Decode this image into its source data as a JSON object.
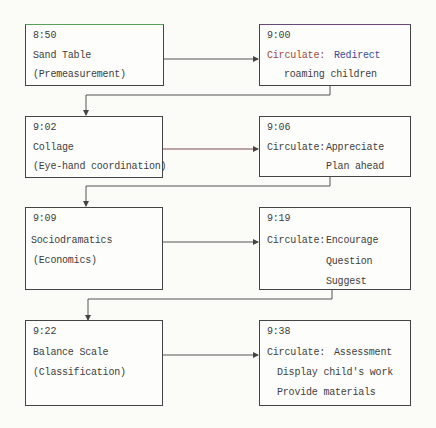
{
  "diagram": {
    "type": "flowchart",
    "rows": [
      {
        "activity": {
          "time": "8:50",
          "title": "Sand Table",
          "subtitle": "(Premeasurement)"
        },
        "circulate": {
          "time": "9:00",
          "label": "Circulate:",
          "actions": [
            "Redirect",
            "roaming children"
          ]
        }
      },
      {
        "activity": {
          "time": "9:02",
          "title": "Collage",
          "subtitle": "(Eye-hand coordination)"
        },
        "circulate": {
          "time": "9:06",
          "label": "Circulate:",
          "actions": [
            "Appreciate",
            "Plan ahead"
          ]
        }
      },
      {
        "activity": {
          "time": "9:09",
          "title": "Sociodramatics",
          "subtitle": "(Economics)"
        },
        "circulate": {
          "time": "9:19",
          "label": "Circulate:",
          "actions": [
            "Encourage",
            "Question",
            "Suggest"
          ]
        }
      },
      {
        "activity": {
          "time": "9:22",
          "title": "Balance Scale",
          "subtitle": "(Classification)"
        },
        "circulate": {
          "time": "9:38",
          "label": "Circulate:",
          "actions": [
            "Assessment",
            "Display child's work",
            "Provide materials"
          ]
        }
      }
    ]
  }
}
